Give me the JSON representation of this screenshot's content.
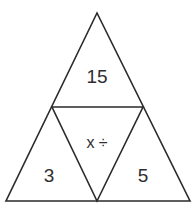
{
  "diagram": {
    "type": "triangle-number-puzzle",
    "colors": {
      "stroke": "#2a2a2a",
      "text": "#2e2e2e",
      "background": "#ffffff"
    },
    "regions": [
      {
        "id": "top",
        "label": "15"
      },
      {
        "id": "center",
        "label": "x ÷"
      },
      {
        "id": "bottom-left",
        "label": "3"
      },
      {
        "id": "bottom-right",
        "label": "5"
      }
    ]
  }
}
